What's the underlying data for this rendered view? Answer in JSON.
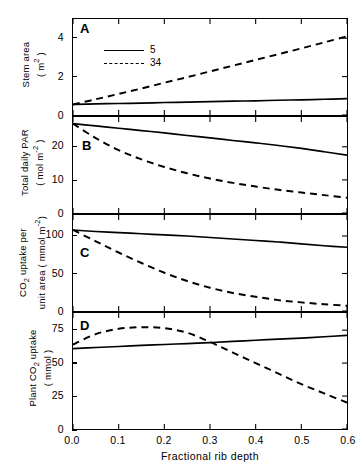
{
  "figure": {
    "panel_letters": {
      "a": "A",
      "b": "B",
      "c": "C",
      "d": "D"
    },
    "legend": {
      "entries": [
        {
          "label": "5",
          "style": "solid"
        },
        {
          "label": "34",
          "style": "dashed"
        }
      ]
    },
    "xaxis": {
      "title": "Fractional rib depth",
      "ticks": [
        "0.0",
        "0.1",
        "0.2",
        "0.3",
        "0.4",
        "0.5",
        "0.6"
      ]
    },
    "colors": {
      "line": "#000000",
      "background": "#ffffff"
    }
  },
  "panels": {
    "a": {
      "ylabel_line1": "Stem area",
      "ylabel_line2": "( m2 )",
      "yticks": [
        "0",
        "2",
        "4"
      ]
    },
    "b": {
      "ylabel_line1": "Total daily PAR",
      "ylabel_line2": "( mol m-2 )",
      "yticks": [
        "0",
        "10",
        "20"
      ]
    },
    "c": {
      "ylabel_line1": "CO2 uptake per",
      "ylabel_line2": "unit area ( mmol m-2)",
      "yticks": [
        "0",
        "50",
        "100"
      ]
    },
    "d": {
      "ylabel_line1": "Plant CO2 uptake",
      "ylabel_line2": "( mmol )",
      "yticks": [
        "0",
        "25",
        "50",
        "75"
      ]
    }
  },
  "chart_data": [
    {
      "id": "panel-a",
      "type": "line",
      "title": "A",
      "xlabel": "Fractional rib depth",
      "ylabel": "Stem area (m2)",
      "xlim": [
        0.0,
        0.6
      ],
      "ylim": [
        0.0,
        5.0
      ],
      "xticks": [
        0.0,
        0.1,
        0.2,
        0.3,
        0.4,
        0.5,
        0.6
      ],
      "yticks": [
        0,
        2,
        4
      ],
      "grid": false,
      "legend_position": "upper-left-inside",
      "x": [
        0.0,
        0.05,
        0.1,
        0.15,
        0.2,
        0.25,
        0.3,
        0.35,
        0.4,
        0.45,
        0.5,
        0.55,
        0.6
      ],
      "series": [
        {
          "name": "5",
          "style": "solid",
          "values": [
            0.55,
            0.58,
            0.6,
            0.62,
            0.65,
            0.67,
            0.7,
            0.72,
            0.74,
            0.77,
            0.79,
            0.82,
            0.85
          ]
        },
        {
          "name": "34",
          "style": "dashed",
          "values": [
            0.55,
            0.82,
            1.1,
            1.38,
            1.68,
            1.97,
            2.27,
            2.57,
            2.87,
            3.17,
            3.47,
            3.78,
            4.1
          ]
        }
      ]
    },
    {
      "id": "panel-b",
      "type": "line",
      "title": "B",
      "xlabel": "Fractional rib depth",
      "ylabel": "Total daily PAR (mol m-2)",
      "xlim": [
        0.0,
        0.6
      ],
      "ylim": [
        0.0,
        29.0
      ],
      "xticks": [
        0.0,
        0.1,
        0.2,
        0.3,
        0.4,
        0.5,
        0.6
      ],
      "yticks": [
        0,
        10,
        20
      ],
      "grid": false,
      "x": [
        0.0,
        0.05,
        0.1,
        0.15,
        0.2,
        0.25,
        0.3,
        0.35,
        0.4,
        0.45,
        0.5,
        0.55,
        0.6
      ],
      "series": [
        {
          "name": "5",
          "style": "solid",
          "values": [
            27.0,
            26.3,
            25.6,
            24.9,
            24.2,
            23.4,
            22.7,
            21.9,
            21.2,
            20.4,
            19.5,
            18.5,
            17.5
          ]
        },
        {
          "name": "34",
          "style": "dashed",
          "values": [
            27.0,
            22.6,
            19.0,
            16.2,
            13.9,
            12.0,
            10.4,
            9.1,
            8.0,
            7.0,
            6.2,
            5.4,
            4.6
          ]
        }
      ]
    },
    {
      "id": "panel-c",
      "type": "line",
      "title": "C",
      "xlabel": "Fractional rib depth",
      "ylabel": "CO2 uptake per unit area (mmol m-2)",
      "xlim": [
        0.0,
        0.6
      ],
      "ylim": [
        0.0,
        128.0
      ],
      "xticks": [
        0.0,
        0.1,
        0.2,
        0.3,
        0.4,
        0.5,
        0.6
      ],
      "yticks": [
        0,
        50,
        100
      ],
      "grid": false,
      "x": [
        0.0,
        0.05,
        0.1,
        0.15,
        0.2,
        0.25,
        0.3,
        0.35,
        0.4,
        0.45,
        0.5,
        0.55,
        0.6
      ],
      "series": [
        {
          "name": "5",
          "style": "solid",
          "values": [
            108.0,
            106.0,
            104.5,
            103.0,
            101.5,
            100.0,
            98.0,
            96.0,
            94.0,
            92.0,
            89.5,
            87.0,
            85.0
          ]
        },
        {
          "name": "34",
          "style": "dashed",
          "values": [
            108.0,
            93.0,
            78.0,
            64.0,
            51.0,
            40.0,
            31.0,
            24.0,
            19.0,
            14.5,
            11.5,
            9.0,
            7.0
          ]
        }
      ]
    },
    {
      "id": "panel-d",
      "type": "line",
      "title": "D",
      "xlabel": "Fractional rib depth",
      "ylabel": "Plant CO2 uptake (mmol)",
      "xlim": [
        0.0,
        0.6
      ],
      "ylim": [
        0.0,
        88.0
      ],
      "xticks": [
        0.0,
        0.1,
        0.2,
        0.3,
        0.4,
        0.5,
        0.6
      ],
      "yticks": [
        0,
        25,
        50,
        75
      ],
      "grid": false,
      "x": [
        0.0,
        0.05,
        0.1,
        0.15,
        0.2,
        0.25,
        0.3,
        0.35,
        0.4,
        0.45,
        0.5,
        0.55,
        0.6
      ],
      "series": [
        {
          "name": "5",
          "style": "solid",
          "values": [
            61.0,
            61.8,
            62.6,
            63.4,
            64.1,
            64.8,
            65.5,
            66.5,
            67.3,
            68.2,
            69.0,
            70.0,
            71.0
          ]
        },
        {
          "name": "34",
          "style": "dashed",
          "values": [
            64.0,
            72.0,
            76.0,
            77.2,
            76.5,
            73.0,
            66.0,
            58.0,
            50.0,
            42.0,
            34.0,
            27.0,
            20.0
          ]
        }
      ]
    }
  ]
}
